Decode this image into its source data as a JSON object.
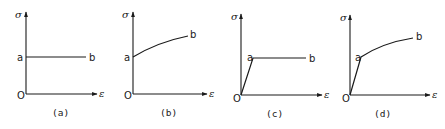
{
  "figure": {
    "axis_labels": {
      "y": "σ",
      "x": "ε",
      "origin": "O"
    },
    "point_labels": {
      "yield": "a",
      "end": "b"
    },
    "panels": [
      {
        "id": "a",
        "caption": "(a)",
        "model": "rigid-perfectly plastic"
      },
      {
        "id": "b",
        "caption": "(b)",
        "model": "rigid-linear/strain hardening"
      },
      {
        "id": "c",
        "caption": "(c)",
        "model": "elastic-perfectly plastic"
      },
      {
        "id": "d",
        "caption": "(d)",
        "model": "elastic-strain hardening"
      }
    ]
  },
  "colors": {
    "ink": "#1a1a1a",
    "background": "#ffffff"
  }
}
